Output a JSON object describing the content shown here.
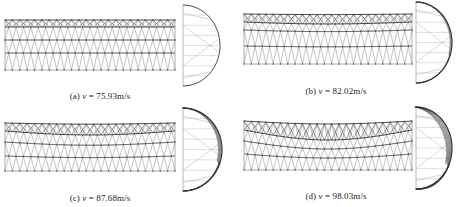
{
  "figure": {
    "panels": [
      {
        "id": "a",
        "label": "(a)",
        "variable": "v",
        "equals": "=",
        "value": "75.93m/s",
        "truss": {
          "x0": 5,
          "x1": 175,
          "y_top": 20,
          "rows": [
            20,
            27,
            40,
            53,
            70
          ],
          "sag": 0,
          "bays": 23
        },
        "side": {
          "x0": 183,
          "y0": 5,
          "y1": 86,
          "peak_x": 220,
          "distortion": 0
        },
        "caption_pos": {
          "x": 100,
          "y": 91
        }
      },
      {
        "id": "b",
        "label": "(b)",
        "variable": "v",
        "equals": "=",
        "value": "82.02m/s",
        "truss": {
          "x0": 244,
          "x1": 412,
          "y_top": 14,
          "rows": [
            14,
            22,
            30,
            46,
            64
          ],
          "sag": 2,
          "bays": 23
        },
        "side": {
          "x0": 416,
          "y0": 2,
          "y1": 83,
          "peak_x": 452,
          "distortion": 1
        },
        "caption_pos": {
          "x": 336,
          "y": 86
        }
      },
      {
        "id": "c",
        "label": "(c)",
        "variable": "v",
        "equals": "=",
        "value": "87.68m/s",
        "truss": {
          "x0": 5,
          "x1": 175,
          "y_top": 123,
          "rows": [
            123,
            131,
            142,
            156,
            171
          ],
          "sag": 4,
          "bays": 23
        },
        "side": {
          "x0": 183,
          "y0": 108,
          "y1": 191,
          "peak_x": 222,
          "distortion": 2
        },
        "caption_pos": {
          "x": 100,
          "y": 193
        }
      },
      {
        "id": "d",
        "label": "(d)",
        "variable": "v",
        "equals": "=",
        "value": "98.03m/s",
        "truss": {
          "x0": 244,
          "x1": 412,
          "y_top": 121,
          "rows": [
            121,
            130,
            141,
            154,
            170
          ],
          "sag": 10,
          "bays": 23
        },
        "side": {
          "x0": 416,
          "y0": 107,
          "y1": 189,
          "peak_x": 452,
          "distortion": 3
        },
        "caption_pos": {
          "x": 336,
          "y": 191
        }
      }
    ],
    "colors": {
      "line": "#8a8a8a",
      "dark": "#333333",
      "node": "#444444",
      "caption": "#222222"
    }
  }
}
